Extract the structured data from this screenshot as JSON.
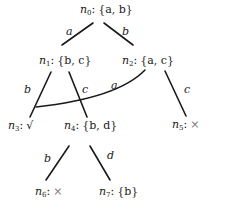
{
  "diagram": {
    "type": "tree",
    "nodes": [
      {
        "id": "n0",
        "name": "n",
        "sub": "0",
        "label": "{a, b}",
        "set": [
          "a",
          "b"
        ]
      },
      {
        "id": "n1",
        "name": "n",
        "sub": "1",
        "label": "{b, c}",
        "set": [
          "b",
          "c"
        ]
      },
      {
        "id": "n2",
        "name": "n",
        "sub": "2",
        "label": "{a, c}",
        "set": [
          "a",
          "c"
        ]
      },
      {
        "id": "n3",
        "name": "n",
        "sub": "3",
        "label": "√",
        "mark": "√"
      },
      {
        "id": "n4",
        "name": "n",
        "sub": "4",
        "label": "{b, d}",
        "set": [
          "b",
          "d"
        ]
      },
      {
        "id": "n5",
        "name": "n",
        "sub": "5",
        "label": "×",
        "mark": "×"
      },
      {
        "id": "n6",
        "name": "n",
        "sub": "6",
        "label": "×",
        "mark": "×"
      },
      {
        "id": "n7",
        "name": "n",
        "sub": "7",
        "label": "{b}",
        "set": [
          "b"
        ]
      }
    ],
    "edges": [
      {
        "from": "n0",
        "to": "n1",
        "label": "a"
      },
      {
        "from": "n0",
        "to": "n2",
        "label": "b"
      },
      {
        "from": "n1",
        "to": "n3",
        "label": "b"
      },
      {
        "from": "n1",
        "to": "n4",
        "label": "c"
      },
      {
        "from": "n2",
        "to": "n3",
        "label": "a"
      },
      {
        "from": "n2",
        "to": "n5",
        "label": "c"
      },
      {
        "from": "n4",
        "to": "n6",
        "label": "b"
      },
      {
        "from": "n4",
        "to": "n7",
        "label": "d"
      }
    ]
  }
}
